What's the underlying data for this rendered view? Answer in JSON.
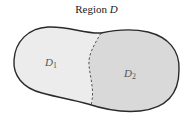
{
  "title": {
    "prefix": "Region ",
    "variable": "D"
  },
  "regions": [
    {
      "name": "D",
      "sub": "1",
      "fill": "#ececec"
    },
    {
      "name": "D",
      "sub": "2",
      "fill": "#d9d9d9"
    }
  ],
  "colors": {
    "outline": "#2a2a2a",
    "divider": "#555555",
    "label": "#555555"
  }
}
